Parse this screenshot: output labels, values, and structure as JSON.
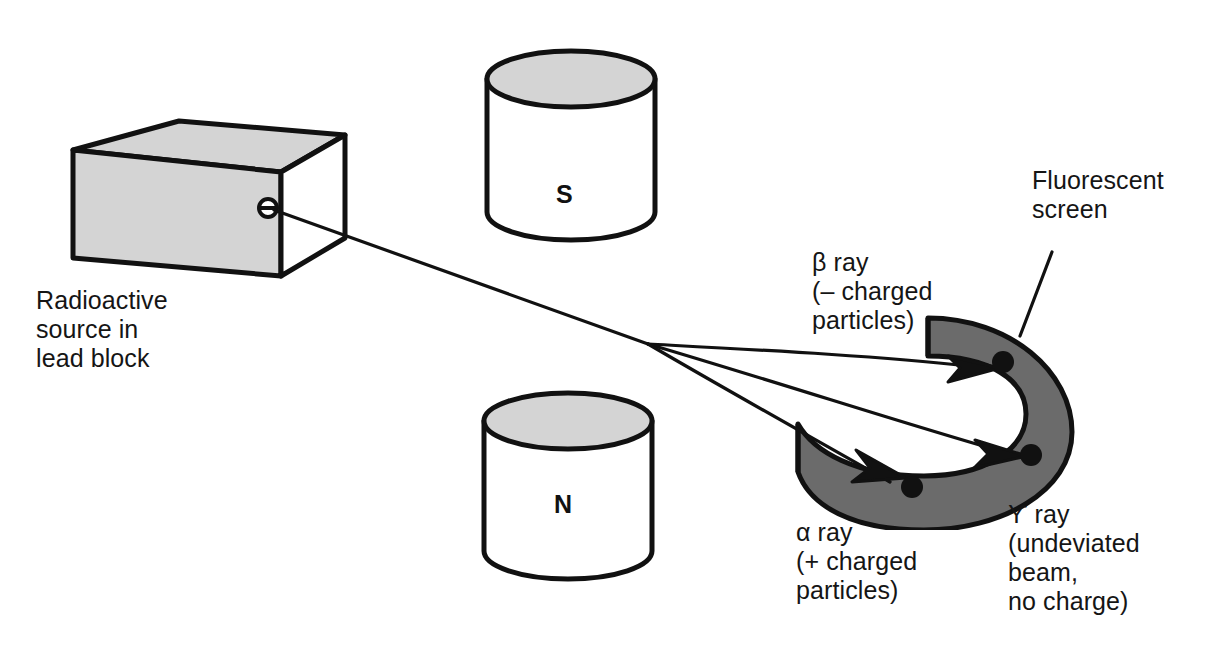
{
  "figure": {
    "background_color": "#ffffff",
    "line_color": "#111111",
    "shade_color": "#d4d4d4",
    "screen_color": "#6b6b6b"
  },
  "labels": {
    "source": "Radioactive\nsource in\nlead block",
    "fluorescent_screen": "Fluorescent\nscreen",
    "beta_ray": "β ray\n(– charged\nparticles)",
    "alpha_ray": "α ray\n(+ charged\nparticles)",
    "gamma_ray": "ϒ ray\n(undeviated\nbeam,\nno charge)"
  },
  "magnets": {
    "south_pole": "S",
    "north_pole": "N"
  },
  "rays": [
    {
      "name": "beta",
      "symbol": "β",
      "charge": "negative",
      "deflection": "upward"
    },
    {
      "name": "gamma",
      "symbol": "ϒ",
      "charge": "none",
      "deflection": "undeviated"
    },
    {
      "name": "alpha",
      "symbol": "α",
      "charge": "positive",
      "deflection": "downward"
    }
  ]
}
